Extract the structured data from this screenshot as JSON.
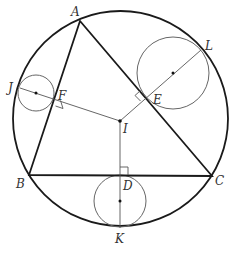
{
  "figure": {
    "type": "geometry-diagram",
    "colors": {
      "stroke": "#1a1a1a",
      "thin": "#555555",
      "background": "#ffffff"
    }
  },
  "labels": {
    "A": "A",
    "B": "B",
    "C": "C",
    "D": "D",
    "E": "E",
    "F": "F",
    "I": "I",
    "J": "J",
    "K": "K",
    "L": "L"
  },
  "points": {
    "A": [
      80,
      21
    ],
    "B": [
      29,
      175
    ],
    "C": [
      212,
      176
    ],
    "I": [
      120,
      121
    ],
    "D": [
      120,
      175
    ],
    "E": [
      146,
      96
    ],
    "F": [
      54,
      98
    ],
    "J": [
      20,
      88
    ],
    "K": [
      120,
      228
    ],
    "L": [
      201,
      50
    ]
  },
  "circles": {
    "circumcircle": {
      "cx": 120.5,
      "cy": 118.5,
      "r": 107.5
    },
    "circle_JF": {
      "cx": 36,
      "cy": 93,
      "r": 18
    },
    "circle_EL": {
      "cx": 173,
      "cy": 73,
      "r": 36
    },
    "circle_DK": {
      "cx": 120,
      "cy": 201,
      "r": 26
    }
  }
}
